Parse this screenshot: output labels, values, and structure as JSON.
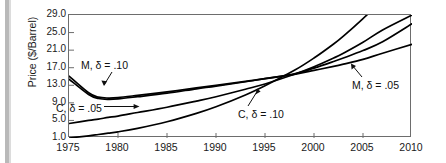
{
  "chart_data": {
    "type": "line",
    "title": "",
    "xlabel": "",
    "ylabel": "Price ($/Barrel)",
    "xlim": [
      1975,
      2010
    ],
    "ylim": [
      1.0,
      29.0
    ],
    "grid": false,
    "legend_position": "inline-annotations",
    "xticks": [
      "1975",
      "1980",
      "1985",
      "1990",
      "1995",
      "2000",
      "2005",
      "2010"
    ],
    "xtick_values": [
      1975,
      1980,
      1985,
      1990,
      1995,
      2000,
      2005,
      2010
    ],
    "yticks": [
      "1.0",
      "5.0",
      "9.0",
      "13.0",
      "17.0",
      "21.0",
      "25.0",
      "29.0"
    ],
    "ytick_values": [
      1.0,
      5.0,
      9.0,
      13.0,
      17.0,
      21.0,
      25.0,
      29.0
    ],
    "x": [
      1975,
      1977,
      1978,
      1979,
      1980,
      1982,
      1985,
      1988,
      1990,
      1993,
      1995,
      1998,
      2000,
      2002,
      2003,
      2005,
      2007,
      2010
    ],
    "series": [
      {
        "name": "M, δ = .10",
        "label": "M, δ = .10",
        "color": "#000000",
        "values": [
          15.1,
          11.3,
          10.3,
          10.1,
          10.2,
          10.7,
          11.5,
          12.4,
          13.0,
          13.9,
          14.5,
          15.5,
          16.4,
          17.3,
          17.8,
          18.9,
          20.3,
          22.3
        ]
      },
      {
        "name": "M, δ = .05",
        "label": "M, δ = .05",
        "color": "#000000",
        "values": [
          14.4,
          10.9,
          10.0,
          9.8,
          9.9,
          10.4,
          11.2,
          12.2,
          12.8,
          13.8,
          14.5,
          15.6,
          16.9,
          18.4,
          19.2,
          20.9,
          22.9,
          27.0
        ]
      },
      {
        "name": "C, δ = .05",
        "label": "C, δ = .05",
        "color": "#000000",
        "values": [
          4.3,
          5.0,
          5.3,
          5.7,
          6.0,
          6.8,
          8.0,
          9.4,
          10.4,
          12.1,
          13.3,
          15.5,
          17.2,
          19.2,
          20.3,
          22.8,
          25.6,
          29.0
        ]
      },
      {
        "name": "C, δ = .10",
        "label": "C, δ = .10",
        "color": "#000000",
        "values": [
          1.0,
          1.5,
          1.8,
          2.1,
          2.4,
          3.2,
          4.7,
          6.6,
          8.1,
          10.8,
          12.9,
          16.4,
          19.2,
          22.4,
          24.2,
          28.2,
          32.5,
          40.0
        ]
      }
    ],
    "annotations": [
      {
        "text": "M, δ = .10",
        "points_to_series": "M, δ = .10"
      },
      {
        "text": "C, δ = .05",
        "points_to_series": "C, δ = .05"
      },
      {
        "text": "C, δ = .10",
        "points_to_series": "C, δ = .10"
      },
      {
        "text": "M, δ = .05",
        "points_to_series": "M, δ = .05"
      }
    ]
  }
}
